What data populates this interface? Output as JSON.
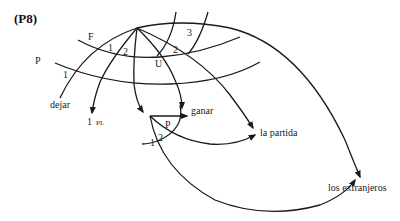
{
  "figure": {
    "label": "(P8)"
  },
  "strata_labels": {
    "outer": "P",
    "inner": "F",
    "upper": "U"
  },
  "relation_labels": {
    "dejar_arc_1": "1",
    "inner_1": "1",
    "inner_2": "2",
    "outer_2": "2",
    "outer_3": "3",
    "sub_P": "P",
    "sub_1": "1",
    "sub_2": "2"
  },
  "terminals": {
    "dejar": "dejar",
    "first_pl_num": "1",
    "first_pl_suffix": "PL",
    "ganar": "ganar",
    "la_partida": "la partida",
    "los_extranjeros": "los extranjeros"
  }
}
